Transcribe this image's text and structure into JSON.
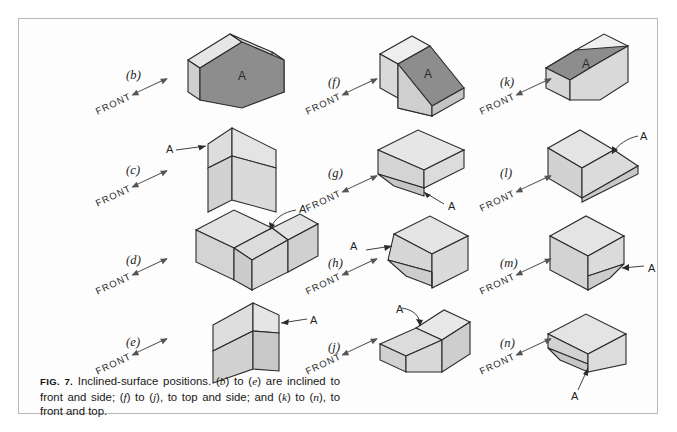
{
  "figure": {
    "number_label": "FIG. 7.",
    "title": "Inclined-surface positions.",
    "caption_part1": "Inclined-surface positions. (",
    "caption_full": "Inclined-surface positions. (b) to (e) are inclined to front and side; (f) to (j), to top and side; and (k) to (n), to front and top.",
    "caption_segments": {
      "s1": "Inclined-surface positions. (",
      "b": "b",
      "s2": ") to (",
      "e": "e",
      "s3": ") are inclined to front and side; (",
      "f": "f",
      "s4": ") to (",
      "j": "j",
      "s5": "), to top and side; and (",
      "k": "k",
      "s6": ") to (",
      "n": "n",
      "s7": "), to front and top."
    }
  },
  "common": {
    "front_label": "FRONT",
    "surface_label": "A",
    "colors": {
      "face_light": "#dcdcdc",
      "face_top": "#e4e4e4",
      "face_side": "#cfcfcf",
      "face_dark": "#8d8d8d",
      "outline": "#2b2b2b",
      "frame": "#b9b9b9",
      "page": "#fdfdfd",
      "text": "#1a1a1a"
    }
  },
  "panels": [
    {
      "id": "b",
      "label": "(b)",
      "column": 1,
      "row": 1,
      "shape": "pentagonal-prism",
      "surface_label": "A",
      "surface_label_mode": "on-face",
      "surface_shading": "dark",
      "front_label": "FRONT",
      "description": "Pentagonal prism with inclined top faces and dark front surface A"
    },
    {
      "id": "c",
      "label": "(c)",
      "column": 1,
      "row": 2,
      "shape": "block-with-inclined-notch",
      "surface_label": "A",
      "surface_label_mode": "leader-left",
      "surface_shading": "light",
      "front_label": "FRONT",
      "description": "Upright block with inclined surface A on the upper left"
    },
    {
      "id": "d",
      "label": "(d)",
      "column": 1,
      "row": 3,
      "shape": "block-with-chamfered-corner",
      "surface_label": "A",
      "surface_label_mode": "leader-upper-right",
      "surface_shading": "light",
      "front_label": "FRONT",
      "description": "Wide block with inclined surface A along the top front corner"
    },
    {
      "id": "e",
      "label": "(e)",
      "column": 1,
      "row": 4,
      "shape": "upright-block-inclined-top",
      "surface_label": "A",
      "surface_label_mode": "leader-right",
      "surface_shading": "light",
      "front_label": "FRONT",
      "description": "Tall block with inclined surface A facing right"
    },
    {
      "id": "f",
      "label": "(f)",
      "column": 2,
      "row": 1,
      "shape": "wedge-ramp",
      "surface_label": "A",
      "surface_label_mode": "on-face",
      "surface_shading": "dark",
      "front_label": "FRONT",
      "description": "Wedge with large dark inclined surface A facing upper left"
    },
    {
      "id": "g",
      "label": "(g)",
      "column": 2,
      "row": 2,
      "shape": "block-with-lower-bevel",
      "surface_label": "A",
      "surface_label_mode": "leader-below",
      "surface_shading": "light",
      "front_label": "FRONT",
      "description": "Low block with inclined surface A at the bottom front"
    },
    {
      "id": "h",
      "label": "(h)",
      "column": 2,
      "row": 3,
      "shape": "block-with-tapered-left",
      "surface_label": "A",
      "surface_label_mode": "leader-left",
      "surface_shading": "light",
      "front_label": "FRONT",
      "description": "Block with tapered inclined surface A on the left side"
    },
    {
      "id": "j",
      "label": "(j)",
      "column": 2,
      "row": 4,
      "shape": "block-with-upper-bevel",
      "surface_label": "A",
      "surface_label_mode": "leader-upper-left",
      "surface_shading": "light",
      "front_label": "FRONT",
      "description": "Block with inclined surface A sloping to the left"
    },
    {
      "id": "k",
      "label": "(k)",
      "column": 3,
      "row": 1,
      "shape": "wedge-ramp-mirrored",
      "surface_label": "A",
      "surface_label_mode": "on-face",
      "surface_shading": "dark",
      "front_label": "FRONT",
      "description": "Wedge with dark inclined surface A facing the viewer"
    },
    {
      "id": "l",
      "label": "(l)",
      "column": 3,
      "row": 2,
      "shape": "block-with-right-wedge",
      "surface_label": "A",
      "surface_label_mode": "leader-upper-right",
      "surface_shading": "light",
      "front_label": "FRONT",
      "description": "Block with inclined surface A projecting to the right"
    },
    {
      "id": "m",
      "label": "(m)",
      "column": 3,
      "row": 3,
      "shape": "block-with-tapered-right",
      "surface_label": "A",
      "surface_label_mode": "leader-right",
      "surface_shading": "light",
      "front_label": "FRONT",
      "description": "Block with tapered inclined surface A on the lower right"
    },
    {
      "id": "n",
      "label": "(n)",
      "column": 3,
      "row": 4,
      "shape": "block-with-front-bevel",
      "surface_label": "A",
      "surface_label_mode": "leader-below",
      "surface_shading": "light",
      "front_label": "FRONT",
      "description": "Block with inclined surface A along the bottom front edge"
    }
  ]
}
